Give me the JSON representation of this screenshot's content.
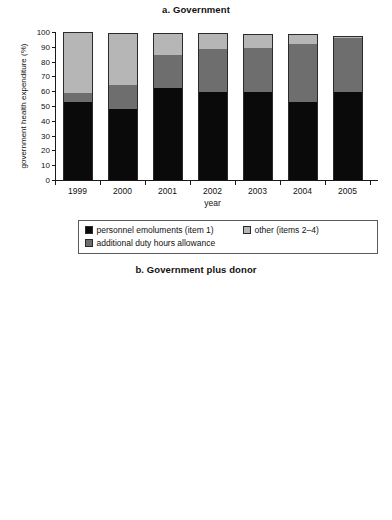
{
  "figure": {
    "panels": [
      "a",
      "b"
    ],
    "colors": {
      "personnel": "#0a0a0a",
      "additional_duty": "#6e6e6e",
      "other": "#b6b6b6"
    },
    "legend": {
      "personnel_label": "personnel emoluments (item 1)",
      "other_label": "other (items 2–4)",
      "additional_label": "additional duty hours allowance"
    }
  },
  "chart_data": [
    {
      "type": "bar",
      "id": "a",
      "title": "a. Government",
      "xlabel": "year",
      "ylabel": "government health expenditure (%)",
      "ylabel_lines": [
        "government health expenditure (%)"
      ],
      "categories": [
        "1999",
        "2000",
        "2001",
        "2002",
        "2003",
        "2004",
        "2005"
      ],
      "yticks": [
        0,
        10,
        20,
        30,
        40,
        50,
        60,
        70,
        80,
        90,
        100
      ],
      "ylim": [
        0,
        100
      ],
      "grid": false,
      "stacked": true,
      "legend_position": "bottom",
      "series": [
        {
          "name": "personnel emoluments (item 1)",
          "color": "#0a0a0a",
          "values": [
            53,
            48,
            62,
            59.5,
            59.5,
            52.5,
            59.5
          ]
        },
        {
          "name": "additional duty hours allowance",
          "color": "#6e6e6e",
          "values": [
            6,
            16,
            22.5,
            29,
            30,
            39.5,
            36.5
          ]
        },
        {
          "name": "other (items 2–4)",
          "color": "#b6b6b6",
          "values": [
            41,
            35.5,
            14.5,
            10.5,
            9,
            6.5,
            1.5
          ]
        }
      ],
      "totals": [
        100,
        99.5,
        99,
        99,
        98.5,
        98.5,
        97.5
      ]
    },
    {
      "type": "bar",
      "id": "b",
      "title": "b. Government plus donor",
      "xlabel": "year",
      "ylabel": "government and donor health expenditure (%)",
      "ylabel_lines": [
        "government and donor health",
        "expenditure (%)"
      ],
      "categories": [
        "1999",
        "2000",
        "2001",
        "2002",
        "2003",
        "2004",
        "2005"
      ],
      "yticks": [
        0,
        20,
        40,
        60,
        80,
        100
      ],
      "ylim": [
        0,
        100
      ],
      "grid": false,
      "stacked": true,
      "legend_position": "bottom",
      "series": [
        {
          "name": "personnel emoluments (item 1)",
          "color": "#0a0a0a",
          "values": [
            33,
            30,
            36,
            35,
            34,
            28,
            41
          ]
        },
        {
          "name": "additional duty hours allowance",
          "color": "#6e6e6e",
          "values": [
            3.5,
            10,
            13,
            16.5,
            17,
            21.5,
            24.5
          ]
        },
        {
          "name": "other (items 2–4)",
          "color": "#b6b6b6",
          "values": [
            63.5,
            59.5,
            50,
            47.5,
            47.5,
            49,
            32.5
          ]
        }
      ],
      "totals": [
        100,
        99.5,
        99,
        99,
        98.5,
        98.5,
        98
      ]
    }
  ]
}
